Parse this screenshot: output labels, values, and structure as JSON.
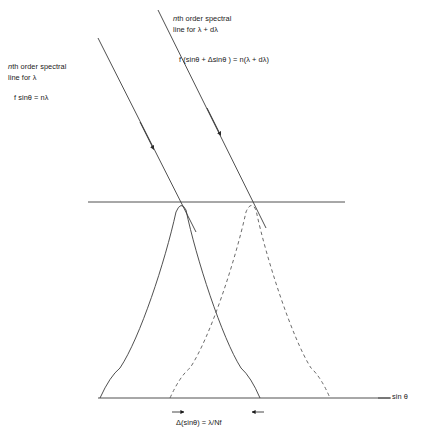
{
  "figure": {
    "background_color": "#ffffff",
    "line_color": "#3c3c3c",
    "text_color": "#1a1a1a"
  },
  "labels": {
    "left_beam": {
      "caption_line1": "nth order spectral",
      "caption_line2": "line for λ",
      "formula": "f sinθ = nλ"
    },
    "right_beam": {
      "caption_line1": "nth order spectral",
      "caption_line2": "line for λ + dλ",
      "formula": "f (sinθ + Δsinθ ) = n(λ + dλ)"
    },
    "axis_label": "sin θ",
    "separation_formula": "Δ(sinθ) = λ/Nf"
  },
  "chart_data": {
    "type": "line",
    "xlabel": "sin θ",
    "ylabel": "",
    "grid": false,
    "legend": "none",
    "axes": {
      "baseline_y": 398,
      "baseline_x_start": 98,
      "baseline_x_end": 390,
      "reference_line_y": 202,
      "reference_line_x_start": 88,
      "reference_line_x_end": 345
    },
    "series": [
      {
        "name": "nth order spectral line for λ",
        "style": "solid",
        "peak_x": 183,
        "peak_y": 202,
        "left_zero_x": 110,
        "right_zero_x": 250
      },
      {
        "name": "nth order spectral line for λ + dλ",
        "style": "dashed",
        "peak_x": 253,
        "peak_y": 202,
        "left_zero_x": 180,
        "right_zero_x": 320
      }
    ],
    "beams": [
      {
        "name": "incident beam for λ",
        "style": "solid",
        "x1": 98,
        "y1": 38,
        "x2": 196,
        "y2": 232,
        "arrow_at_x": 150,
        "arrow_at_y": 142
      },
      {
        "name": "incident beam for λ + dλ",
        "style": "solid",
        "x1": 158,
        "y1": 10,
        "x2": 266,
        "y2": 228,
        "arrow_at_x": 218,
        "arrow_at_y": 160
      }
    ],
    "annotations": [
      {
        "name": "peak-separation",
        "text": "Δ(sinθ) = λ/Nf",
        "from_x": 183,
        "to_x": 253,
        "y": 412
      }
    ]
  }
}
